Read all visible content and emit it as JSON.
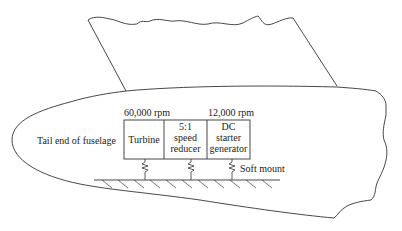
{
  "diagram": {
    "labels": {
      "turbine_speed": "60,000 rpm",
      "generator_speed": "12,000 rpm",
      "tail_end": "Tail end of fuselage",
      "soft_mount": "Soft mount"
    },
    "boxes": [
      {
        "line1": "Turbine",
        "line2": "",
        "line3": ""
      },
      {
        "line1": "5:1",
        "line2": "speed",
        "line3": "reducer"
      },
      {
        "line1": "DC",
        "line2": "starter",
        "line3": "generator"
      }
    ]
  }
}
